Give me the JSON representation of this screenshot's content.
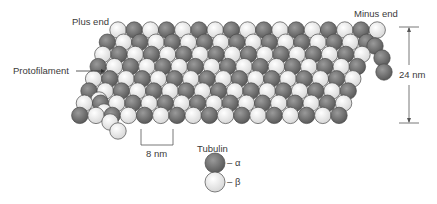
{
  "diagram": {
    "labels": {
      "plus_end": "Plus end",
      "minus_end": "Minus end",
      "protofilament": "Protofilament",
      "diameter": "24 nm",
      "spacing": "8 nm"
    },
    "legend": {
      "title": "Tubulin",
      "items": [
        {
          "symbol": "– α",
          "color": "#707070"
        },
        {
          "symbol": "– β",
          "color": "#f0f0f0"
        }
      ]
    },
    "colors": {
      "alpha": "#707070",
      "beta": "#efefef",
      "outline": "#4a4a4a"
    }
  }
}
